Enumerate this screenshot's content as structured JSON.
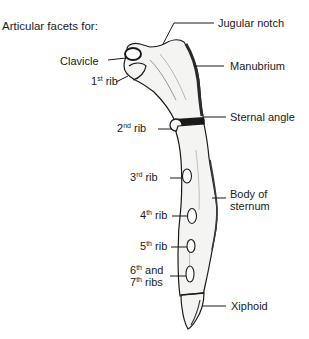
{
  "diagram": {
    "title": "Articular facets for:",
    "labels_left": [
      {
        "id": "clavicle",
        "text": "Clavicle",
        "sup": "",
        "suffix": ""
      },
      {
        "id": "rib1",
        "text": "1",
        "sup": "st",
        "suffix": " rib"
      },
      {
        "id": "rib2",
        "text": "2",
        "sup": "nd",
        "suffix": " rib"
      },
      {
        "id": "rib3",
        "text": "3",
        "sup": "rd",
        "suffix": " rib"
      },
      {
        "id": "rib4",
        "text": "4",
        "sup": "th",
        "suffix": " rib"
      },
      {
        "id": "rib5",
        "text": "5",
        "sup": "th",
        "suffix": " rib"
      },
      {
        "id": "rib67_line1",
        "text": "6",
        "sup": "th",
        "suffix": " and"
      },
      {
        "id": "rib67_line2",
        "text": "7",
        "sup": "th",
        "suffix": " ribs"
      }
    ],
    "labels_right": [
      {
        "id": "jugular-notch",
        "text": "Jugular notch"
      },
      {
        "id": "manubrium",
        "text": "Manubrium"
      },
      {
        "id": "sternal-angle",
        "text": "Sternal angle"
      },
      {
        "id": "body-of-sternum-1",
        "text": "Body of"
      },
      {
        "id": "body-of-sternum-2",
        "text": "sternum"
      },
      {
        "id": "xiphoid",
        "text": "Xiphoid"
      }
    ],
    "colors": {
      "ink": "#1a1a1a",
      "bone_fill": "#f4f4f2",
      "shade": "#3a3a3a"
    }
  }
}
